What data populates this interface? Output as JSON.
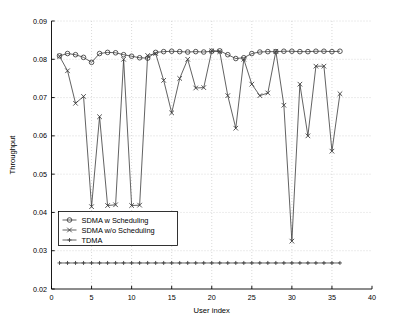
{
  "figure": {
    "background": "#ffffff",
    "axes_color": "#000000",
    "grid_color": "#c8c8c8",
    "series_color": "#3a3a3a"
  },
  "chart_data": {
    "type": "line",
    "title": "",
    "xlabel": "User index",
    "ylabel": "Throughput",
    "xlim": [
      0,
      40
    ],
    "ylim": [
      0.02,
      0.09
    ],
    "xticks": [
      0,
      5,
      10,
      15,
      20,
      25,
      30,
      35,
      40
    ],
    "xtick_labels": [
      "0",
      "5",
      "10",
      "15",
      "20",
      "25",
      "30",
      "35",
      "40"
    ],
    "yticks": [
      0.02,
      0.03,
      0.04,
      0.05,
      0.06,
      0.07,
      0.08,
      0.09
    ],
    "ytick_labels": [
      "0.02",
      "0.03",
      "0.04",
      "0.05",
      "0.06",
      "0.07",
      "0.08",
      "0.09"
    ],
    "grid": true,
    "grid_style": "dotted",
    "legend_position": "lower left",
    "x": [
      1,
      2,
      3,
      4,
      5,
      6,
      7,
      8,
      9,
      10,
      11,
      12,
      13,
      14,
      15,
      16,
      17,
      18,
      19,
      20,
      21,
      22,
      23,
      24,
      25,
      26,
      27,
      28,
      29,
      30,
      31,
      32,
      33,
      34,
      35,
      36
    ],
    "series": [
      {
        "name": "SDMA w Scheduling",
        "marker": "circle",
        "values": [
          0.0809,
          0.0815,
          0.0812,
          0.0805,
          0.0792,
          0.0815,
          0.0818,
          0.0817,
          0.0812,
          0.0808,
          0.0804,
          0.0803,
          0.0818,
          0.082,
          0.0821,
          0.082,
          0.0819,
          0.082,
          0.0819,
          0.0821,
          0.0822,
          0.0812,
          0.0802,
          0.0804,
          0.0815,
          0.0819,
          0.082,
          0.082,
          0.0821,
          0.0821,
          0.082,
          0.082,
          0.0821,
          0.0821,
          0.082,
          0.0821
        ]
      },
      {
        "name": "SDMA w/o Scheduling",
        "marker": "x",
        "values": [
          0.0808,
          0.077,
          0.0685,
          0.0703,
          0.0415,
          0.065,
          0.0418,
          0.042,
          0.08,
          0.0418,
          0.0419,
          0.081,
          0.0815,
          0.0745,
          0.066,
          0.075,
          0.08,
          0.0725,
          0.0726,
          0.0822,
          0.082,
          0.0705,
          0.062,
          0.08,
          0.0735,
          0.0705,
          0.0712,
          0.0821,
          0.068,
          0.0325,
          0.0735,
          0.06,
          0.0782,
          0.0782,
          0.056,
          0.071
        ]
      },
      {
        "name": "TDMA",
        "marker": "plus",
        "values": [
          0.0268,
          0.0268,
          0.0268,
          0.0268,
          0.0268,
          0.0268,
          0.0268,
          0.0268,
          0.0268,
          0.0268,
          0.0268,
          0.0268,
          0.0268,
          0.0268,
          0.0268,
          0.0268,
          0.0268,
          0.0268,
          0.0268,
          0.0268,
          0.0268,
          0.0268,
          0.0268,
          0.0268,
          0.0268,
          0.0268,
          0.0268,
          0.0268,
          0.0268,
          0.0268,
          0.0268,
          0.0268,
          0.0268,
          0.0268,
          0.0268,
          0.0268
        ]
      }
    ]
  },
  "legend": {
    "items": [
      {
        "label": "SDMA w Scheduling",
        "marker": "circle"
      },
      {
        "label": "SDMA w/o Scheduling",
        "marker": "x"
      },
      {
        "label": "TDMA",
        "marker": "plus"
      }
    ]
  }
}
